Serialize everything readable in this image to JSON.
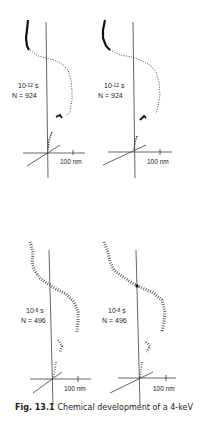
{
  "figure": {
    "caption_label": "Fig. 13.1",
    "caption_text": "Chemical development of a 4-keV",
    "panels": [
      {
        "time_base": "10",
        "time_exp": "-12",
        "time_unit": "s",
        "n_label": "N = 924",
        "scale": "100 nm"
      },
      {
        "time_base": "10",
        "time_exp": "-12",
        "time_unit": "s",
        "n_label": "N = 924",
        "scale": "100 nm"
      },
      {
        "time_base": "10",
        "time_exp": "-8",
        "time_unit": "s",
        "n_label": "N = 496",
        "scale": "100 nm"
      },
      {
        "time_base": "10",
        "time_exp": "-8",
        "time_unit": "s",
        "n_label": "N = 496",
        "scale": "100 nm"
      }
    ]
  }
}
